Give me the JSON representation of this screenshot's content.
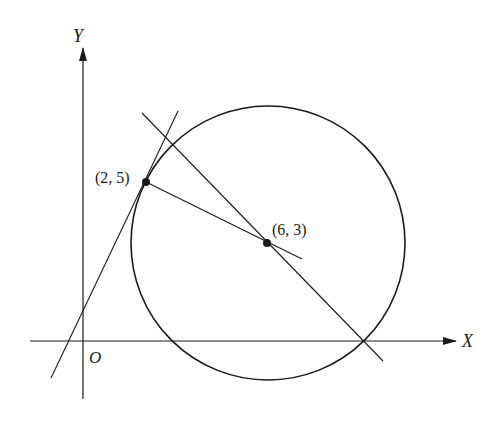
{
  "diagram": {
    "axes": {
      "x_label": "X",
      "y_label": "Y",
      "origin_label": "O"
    },
    "points": [
      {
        "id": "tangent-point",
        "label": "(2, 5)"
      },
      {
        "id": "center",
        "label": "(6, 3)"
      }
    ],
    "circle": {
      "center": "(6, 3)",
      "passes_through": "(2, 5)"
    },
    "lines": [
      {
        "id": "tangent-line",
        "description": "tangent to circle at (2, 5)"
      },
      {
        "id": "radius-line",
        "description": "line through (2, 5) and center (6, 3)"
      },
      {
        "id": "secant-line",
        "description": "line through center (6, 3), perpendicular-ish, crossing x-axis at circle"
      }
    ],
    "colors": {
      "stroke": "#1a1a1a",
      "background": "#ffffff"
    }
  }
}
